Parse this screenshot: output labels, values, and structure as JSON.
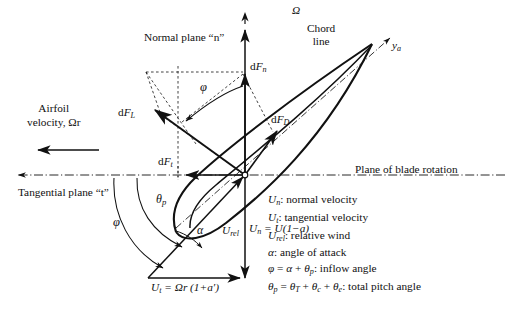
{
  "figure": {
    "background_color": "#ffffff",
    "line_color": "#111111",
    "width": 513,
    "height": 314
  },
  "axes": {
    "rotation_axis_label": "Ω",
    "chord_axis_label_main": "y",
    "chord_axis_label_sub": "a",
    "plane_of_rotation_label": "Plane of blade rotation",
    "normal_plane_label": "Normal plane “n”",
    "tangential_plane_label": "Tangential plane “t”",
    "chord_line_label_line1": "Chord",
    "chord_line_label_line2": "line"
  },
  "forces": {
    "normal": {
      "prefix": "d",
      "symbol": "F",
      "sub": "n"
    },
    "tangential": {
      "prefix": "d",
      "symbol": "F",
      "sub": "t"
    },
    "lift": {
      "prefix": "d",
      "symbol": "F",
      "sub": "L"
    },
    "drag": {
      "prefix": "d",
      "symbol": "F",
      "sub": "D"
    }
  },
  "velocities": {
    "airfoil_velocity_line1": "Airfoil",
    "airfoil_velocity_line2": "velocity, Ωr",
    "relative_wind": {
      "symbol": "U",
      "sub": "rel"
    },
    "normal_velocity_eq": {
      "symbol": "U",
      "sub": "n",
      "expr": " = U(1−a)"
    },
    "tangential_velocity_eq": {
      "symbol": "U",
      "sub": "t",
      "expr": " = Ωr (1+a′)"
    }
  },
  "angles": {
    "inflow": "φ",
    "pitch": {
      "symbol": "θ",
      "sub": "p"
    },
    "attack": "α"
  },
  "legend": {
    "items": [
      {
        "symbol": "U",
        "sub": "n",
        "text": ": normal velocity"
      },
      {
        "symbol": "U",
        "sub": "t",
        "text": ": tangential velocity"
      },
      {
        "symbol": "U",
        "sub": "rel",
        "text": ": relative wind"
      },
      {
        "symbol": "α",
        "sub": "",
        "text": ": angle of attack"
      },
      {
        "symbol": "φ",
        "sub": "",
        "text": " = α + θₚ: inflow angle"
      },
      {
        "symbol": "θ",
        "sub": "p",
        "text": " = θₜ + θᴄ + θₑ: total pitch angle"
      }
    ],
    "line_inflow_html": "φ = α + θp: inflow angle",
    "line_pitch_html": "θp = θT + θc + θe: total pitch angle"
  }
}
